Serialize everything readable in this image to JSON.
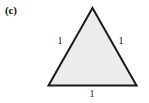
{
  "figure": {
    "panel_label": "(c)",
    "background_color": "#ffffff",
    "shape": {
      "name": "equilateral-triangle",
      "fill_color": "#ececec",
      "stroke_color": "#1a1a1a",
      "stroke_width": 2,
      "vertices": [
        {
          "name": "apex",
          "x": 92.5,
          "y": 8
        },
        {
          "name": "bottom-right",
          "x": 136.5,
          "y": 85.5
        },
        {
          "name": "bottom-left",
          "x": 48.5,
          "y": 85.5
        }
      ]
    },
    "side_labels": {
      "left": "1",
      "right": "1",
      "base": "1"
    }
  }
}
